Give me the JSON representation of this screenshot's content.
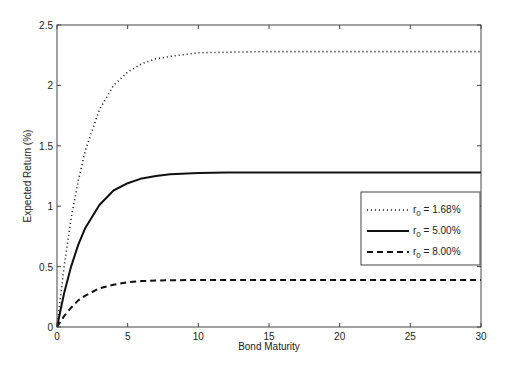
{
  "chart_data": {
    "type": "line",
    "title": "",
    "xlabel": "Bond Maturity",
    "ylabel": "Expected Return (%)",
    "xlim": [
      0,
      30
    ],
    "ylim": [
      0,
      2.5
    ],
    "xticks": [
      0,
      5,
      10,
      15,
      20,
      25,
      30
    ],
    "yticks": [
      0,
      0.5,
      1,
      1.5,
      2,
      2.5
    ],
    "ytick_labels": [
      "0",
      "0.5",
      "1",
      "1.5",
      "2",
      "2.5"
    ],
    "grid": false,
    "legend_position": "right-middle",
    "x": [
      0,
      0.5,
      1,
      1.5,
      2,
      3,
      4,
      5,
      6,
      7,
      8,
      10,
      12,
      15,
      20,
      25,
      30
    ],
    "series": [
      {
        "name": "r_0 = 1.68%",
        "style": "dotted",
        "values": [
          0,
          0.5,
          0.9,
          1.21,
          1.46,
          1.8,
          2.0,
          2.11,
          2.18,
          2.22,
          2.24,
          2.27,
          2.275,
          2.28,
          2.28,
          2.28,
          2.28
        ]
      },
      {
        "name": "r_0 = 5.00%",
        "style": "solid",
        "values": [
          0,
          0.28,
          0.5,
          0.68,
          0.82,
          1.01,
          1.13,
          1.19,
          1.23,
          1.25,
          1.265,
          1.275,
          1.278,
          1.28,
          1.28,
          1.28,
          1.28
        ]
      },
      {
        "name": "r_0 = 8.00%",
        "style": "dashed",
        "values": [
          0,
          0.09,
          0.16,
          0.22,
          0.26,
          0.32,
          0.35,
          0.37,
          0.38,
          0.385,
          0.387,
          0.39,
          0.39,
          0.39,
          0.39,
          0.39,
          0.39
        ]
      }
    ]
  },
  "legend": [
    {
      "prefix": "r",
      "sub": "0",
      "suffix": " = 1.68%"
    },
    {
      "prefix": "r",
      "sub": "0",
      "suffix": " = 5.00%"
    },
    {
      "prefix": "r",
      "sub": "0",
      "suffix": " = 8.00%"
    }
  ]
}
